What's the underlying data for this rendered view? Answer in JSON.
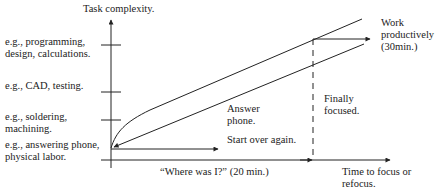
{
  "diagram": {
    "y_axis_title": "Task complexity.",
    "x_axis_title": "Time to focus or\nrefocus.",
    "levels": [
      {
        "label": "e.g., programming,\ndesign, calculations."
      },
      {
        "label": "e.g., CAD, testing."
      },
      {
        "label": "e.g., soldering,\nmachining."
      },
      {
        "label": "e.g., answering phone,\nphysical labor."
      }
    ],
    "annotations": {
      "work_productively": "Work\nproductively\n(30min.)",
      "finally_focused": "Finally\nfocused.",
      "answer_phone": "Answer\nphone.",
      "start_over": "Start over again.",
      "where_was_i": "“Where was I?” (20 min.)"
    },
    "colors": {
      "line": "#222222",
      "background": "#ffffff"
    }
  }
}
